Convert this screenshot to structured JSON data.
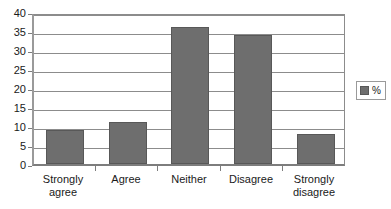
{
  "chart_data": {
    "type": "bar",
    "title": "",
    "subtitle": "",
    "xlabel": "",
    "ylabel": "",
    "categories": [
      "Strongly agree",
      "Agree",
      "Neither",
      "Disagree",
      "Strongly disagree"
    ],
    "category_lines": [
      [
        "Strongly",
        "agree"
      ],
      [
        "Agree",
        ""
      ],
      [
        "Neither",
        ""
      ],
      [
        "Disagree",
        ""
      ],
      [
        "Strongly",
        "disagree"
      ]
    ],
    "series": [
      {
        "name": "%",
        "values": [
          9,
          11,
          36,
          34,
          8
        ],
        "color": "#6e6e6e"
      }
    ],
    "values": [
      9,
      11,
      36,
      34,
      8
    ],
    "ylim": [
      0,
      40
    ],
    "ytick_step": 5,
    "yticks": [
      40,
      35,
      30,
      25,
      20,
      15,
      10,
      5,
      0
    ],
    "ytick_labels": [
      "40",
      "35",
      "30",
      "25",
      "20",
      "15",
      "10",
      "5",
      "0"
    ],
    "grid": true,
    "grid_axis": "y",
    "legend": {
      "position": "right",
      "entries": [
        {
          "label": "%",
          "color": "#6e6e6e"
        }
      ]
    },
    "colors": {
      "bar_fill": "#6e6e6e",
      "bar_border": "#585858",
      "gridline": "#8c8c8c",
      "axis": "#7d7d7d",
      "plot_background": "#ffffff",
      "text": "#1a1a1a"
    }
  }
}
